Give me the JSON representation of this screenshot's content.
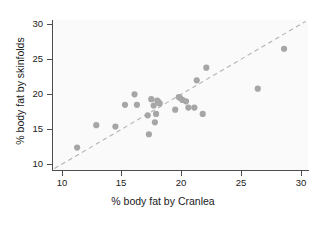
{
  "chart_data": {
    "type": "scatter",
    "title": "",
    "xlabel": "% body fat by Cranlea",
    "ylabel": "% body fat by skinfolds",
    "xlim": [
      9.2,
      30.6
    ],
    "ylim": [
      9.2,
      30.6
    ],
    "xticks": [
      10,
      15,
      20,
      25,
      30
    ],
    "yticks": [
      10,
      15,
      20,
      25,
      30
    ],
    "xticklabels": [
      "10",
      "15",
      "20",
      "25",
      "30"
    ],
    "yticklabels": [
      "10",
      "15",
      "20",
      "25",
      "30"
    ],
    "grid": false,
    "legend": "none",
    "marker_color": "#a6a6a6",
    "reference_line": {
      "style": "dashed",
      "color": "#b3b3b3",
      "description": "line of equality y = x",
      "x": [
        9.4,
        30.4
      ],
      "y": [
        9.4,
        30.4
      ]
    },
    "points": [
      {
        "x": 11.3,
        "y": 12.4
      },
      {
        "x": 12.9,
        "y": 15.6
      },
      {
        "x": 14.5,
        "y": 15.4
      },
      {
        "x": 15.3,
        "y": 18.5
      },
      {
        "x": 16.1,
        "y": 20.0
      },
      {
        "x": 16.3,
        "y": 18.5
      },
      {
        "x": 17.2,
        "y": 17.0
      },
      {
        "x": 17.3,
        "y": 14.3
      },
      {
        "x": 17.5,
        "y": 19.3
      },
      {
        "x": 17.7,
        "y": 18.4
      },
      {
        "x": 17.8,
        "y": 16.0
      },
      {
        "x": 17.9,
        "y": 17.2
      },
      {
        "x": 18.0,
        "y": 19.1
      },
      {
        "x": 18.1,
        "y": 18.9
      },
      {
        "x": 18.2,
        "y": 18.7
      },
      {
        "x": 19.5,
        "y": 17.8
      },
      {
        "x": 19.8,
        "y": 19.6
      },
      {
        "x": 19.9,
        "y": 19.5
      },
      {
        "x": 20.1,
        "y": 19.2
      },
      {
        "x": 20.4,
        "y": 19.0
      },
      {
        "x": 20.6,
        "y": 18.1
      },
      {
        "x": 21.1,
        "y": 18.1
      },
      {
        "x": 21.3,
        "y": 22.0
      },
      {
        "x": 21.8,
        "y": 17.2
      },
      {
        "x": 22.1,
        "y": 23.8
      },
      {
        "x": 26.4,
        "y": 20.8
      },
      {
        "x": 28.6,
        "y": 26.5
      }
    ]
  }
}
